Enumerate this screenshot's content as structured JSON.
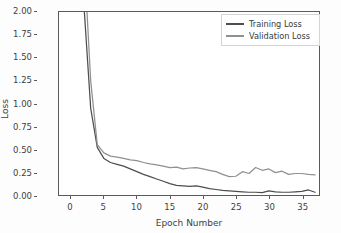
{
  "chart_data": {
    "type": "line",
    "title": "",
    "xlabel": "Epoch Number",
    "ylabel": "Loss",
    "xlim": [
      -1.8,
      37.6
    ],
    "ylim": [
      0.0,
      2.0
    ],
    "grid": false,
    "legend_position": "upper right",
    "xticks": [
      "0",
      "5",
      "10",
      "15",
      "20",
      "25",
      "30",
      "35"
    ],
    "xtick_values": [
      0,
      5,
      10,
      15,
      20,
      25,
      30,
      35
    ],
    "yticks": [
      "0.00",
      "0.25",
      "0.50",
      "0.75",
      "1.00",
      "1.25",
      "1.50",
      "1.75",
      "2.00"
    ],
    "ytick_values": [
      0.0,
      0.25,
      0.5,
      0.75,
      1.0,
      1.25,
      1.5,
      1.75,
      2.0
    ],
    "x": [
      1,
      2,
      3,
      4,
      5,
      6,
      7,
      8,
      9,
      10,
      11,
      12,
      13,
      14,
      15,
      16,
      17,
      18,
      19,
      20,
      21,
      22,
      23,
      24,
      25,
      26,
      27,
      28,
      29,
      30,
      31,
      32,
      33,
      34,
      35,
      36,
      37
    ],
    "series": [
      {
        "name": "Training Loss",
        "color": "#4d4d4d",
        "values": [
          3.3,
          2.05,
          0.95,
          0.52,
          0.4,
          0.355,
          0.335,
          0.315,
          0.285,
          0.255,
          0.225,
          0.2,
          0.175,
          0.15,
          0.125,
          0.105,
          0.1,
          0.095,
          0.1,
          0.085,
          0.07,
          0.06,
          0.05,
          0.045,
          0.04,
          0.035,
          0.03,
          0.03,
          0.025,
          0.045,
          0.035,
          0.03,
          0.03,
          0.035,
          0.04,
          0.055,
          0.03
        ]
      },
      {
        "name": "Validation Loss",
        "color": "#909090",
        "values": [
          3.0,
          2.6,
          1.25,
          0.55,
          0.46,
          0.425,
          0.415,
          0.4,
          0.385,
          0.375,
          0.355,
          0.34,
          0.33,
          0.315,
          0.3,
          0.305,
          0.285,
          0.295,
          0.3,
          0.285,
          0.27,
          0.255,
          0.225,
          0.2,
          0.205,
          0.255,
          0.235,
          0.3,
          0.27,
          0.285,
          0.245,
          0.26,
          0.225,
          0.235,
          0.235,
          0.225,
          0.22
        ]
      }
    ]
  },
  "legend": {
    "entries": [
      {
        "label": "Training Loss"
      },
      {
        "label": "Validation Loss"
      }
    ]
  },
  "axes": {
    "frame_color": "#5a5a5a",
    "tick_color": "#5a5a5a",
    "background": "#ffffff"
  }
}
